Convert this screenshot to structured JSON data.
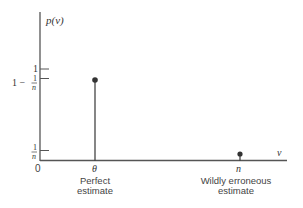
{
  "diagram": {
    "y_axis_label": "p(v)",
    "x_axis_label": "v",
    "origin_label": "0",
    "y_ticks": [
      {
        "label_whole": "1",
        "label_num": "",
        "label_den": ""
      },
      {
        "label_prefix": "1 −",
        "label_num": "1",
        "label_den": "n"
      },
      {
        "label_num": "1",
        "label_den": "n"
      }
    ],
    "x_ticks": [
      {
        "label": "θ"
      },
      {
        "label": "n"
      }
    ],
    "annotations": [
      {
        "line1": "Perfect",
        "line2": "estimate"
      },
      {
        "line1": "Wildly erroneous",
        "line2": "estimate"
      }
    ],
    "colors": {
      "axis": "#555555",
      "stem": "#444444",
      "dot": "#333333"
    }
  }
}
